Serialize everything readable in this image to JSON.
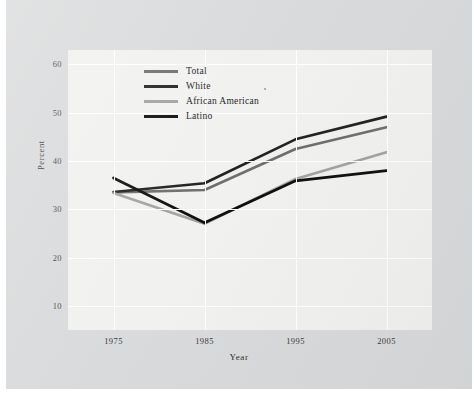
{
  "figure": {
    "background_color": "#d9dadb",
    "plot_background_color": "#f1f1f0",
    "gridline_color": "#ffffff"
  },
  "chart_data": {
    "type": "line",
    "title": "",
    "xlabel": "Year",
    "ylabel": "Percent",
    "categories": [
      "1975",
      "1985",
      "1995",
      "2005"
    ],
    "x": [
      1975,
      1985,
      1995,
      2005
    ],
    "xlim": [
      1970,
      2010
    ],
    "ylim": [
      5,
      63
    ],
    "yticks": [
      10,
      20,
      30,
      40,
      50,
      60
    ],
    "ytick_labels": [
      "10",
      "20",
      "30",
      "40",
      "50",
      "60"
    ],
    "xtick_labels": [
      "1975",
      "1985",
      "1995",
      "2005"
    ],
    "grid": true,
    "legend_position": "upper left",
    "series": [
      {
        "name": "Total",
        "color": "#6f6f6f",
        "width": 2.6,
        "values": [
          33.5,
          34.0,
          42.5,
          47.0
        ]
      },
      {
        "name": "White",
        "color": "#232323",
        "width": 2.6,
        "values": [
          33.6,
          35.4,
          44.5,
          49.2
        ]
      },
      {
        "name": "African American",
        "color": "#a3a3a3",
        "width": 2.6,
        "values": [
          33.4,
          27.0,
          36.3,
          41.8
        ]
      },
      {
        "name": "Latino",
        "color": "#111111",
        "width": 2.8,
        "values": [
          36.5,
          27.2,
          35.9,
          38.0
        ]
      }
    ]
  },
  "legend": {
    "items": [
      {
        "label": "Total",
        "color": "#6f6f6f"
      },
      {
        "label": "White",
        "color": "#232323"
      },
      {
        "label": "African American",
        "color": "#a3a3a3"
      },
      {
        "label": "Latino",
        "color": "#111111"
      }
    ]
  },
  "axes": {
    "y_tick_labels": [
      "60",
      "50",
      "40",
      "30",
      "20",
      "10"
    ],
    "x_tick_labels": [
      "1975",
      "1985",
      "1995",
      "2005"
    ],
    "y_axis_title": "Percent",
    "x_axis_title": "Year"
  }
}
